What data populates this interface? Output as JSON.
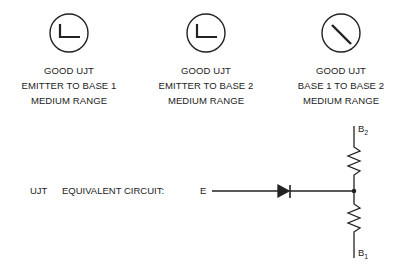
{
  "meters": [
    {
      "icon": "needle-at-zero-icon",
      "lines": [
        "GOOD UJT",
        "EMITTER TO BASE 1",
        "MEDIUM RANGE"
      ]
    },
    {
      "icon": "needle-at-zero-icon",
      "lines": [
        "GOOD UJT",
        "EMITTER TO BASE 2",
        "MEDIUM RANGE"
      ]
    },
    {
      "icon": "needle-deflected-icon",
      "lines": [
        "GOOD UJT",
        "BASE 1 TO BASE 2",
        "MEDIUM RANGE"
      ]
    }
  ],
  "circuit": {
    "prefix": "UJT",
    "title": "EQUIVALENT CIRCUIT:",
    "emitter_label": "E",
    "base2_label": "B",
    "base2_sub": "2",
    "base1_label": "B",
    "base1_sub": "1"
  }
}
